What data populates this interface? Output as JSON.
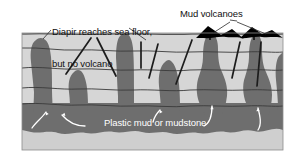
{
  "figure": {
    "type": "geological-cross-section",
    "background_color": "#ffffff"
  },
  "labels": {
    "diapir": {
      "line1": "Diapir reaches sea floor,",
      "line2": "but no volcano"
    },
    "mud_volcanoes": "Mud volcanoes",
    "plastic_layer": "Plastic mud or mudstone"
  },
  "colors": {
    "sediment_light": "#d9d9d9",
    "sediment_fill": "#d4d4d4",
    "plastic_mud": "#6e6e6e",
    "diapir": "#6e6e6e",
    "volcano_black": "#000000",
    "basement": "#c9c9c9",
    "stroke": "#3a3a3a",
    "arrow_white": "#ffffff",
    "label_text": "#111111",
    "plastic_text": "#ffffff"
  },
  "elements": {
    "diapir_count": 7,
    "volcano_count": 2,
    "flow_arrow_count": 5,
    "fault_count": 6,
    "bedding_layer_count": 4
  }
}
